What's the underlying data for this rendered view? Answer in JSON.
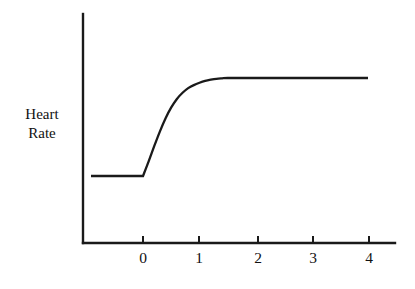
{
  "chart_data": {
    "type": "line",
    "title": "",
    "subtitle": "",
    "xlabel": "",
    "ylabel": "Heart Rate",
    "ylabel_lines": [
      "Heart",
      "Rate"
    ],
    "x_tick_labels": [
      "0",
      "1",
      "2",
      "3",
      "4"
    ],
    "x_tick_values": [
      0,
      1,
      2,
      3,
      4
    ],
    "y_tick_labels": [],
    "xlim": [
      -0.93,
      4.5
    ],
    "ylim": [
      0,
      1.38
    ],
    "grid": false,
    "legend": null,
    "annotations": [],
    "axis_style": {
      "x_axis": true,
      "y_axis": true,
      "ticks_direction": "up",
      "color": "#1a1a1a"
    },
    "series": [
      {
        "name": "Heart Rate",
        "color": "#1a1a1a",
        "description": "Flat baseline before time 0, rapid rise starting at 0, exponential approach to a steady plateau reached by about t=1.5, held flat to t=4",
        "x": [
          -0.93,
          -0.7,
          -0.5,
          -0.3,
          -0.1,
          0.0,
          0.1,
          0.2,
          0.3,
          0.4,
          0.5,
          0.6,
          0.7,
          0.8,
          0.9,
          1.0,
          1.1,
          1.2,
          1.3,
          1.4,
          1.5,
          1.75,
          2.0,
          2.5,
          3.0,
          3.5,
          4.0
        ],
        "y": [
          0.405,
          0.405,
          0.405,
          0.405,
          0.405,
          0.405,
          0.5,
          0.6,
          0.695,
          0.78,
          0.85,
          0.905,
          0.945,
          0.975,
          0.995,
          1.01,
          1.022,
          1.03,
          1.036,
          1.039,
          1.041,
          1.041,
          1.041,
          1.041,
          1.041,
          1.041,
          1.041
        ]
      }
    ]
  },
  "geometry": {
    "width": 415,
    "height": 289,
    "axis_origin_x": 83,
    "axis_origin_y": 243,
    "axis_top_y": 14,
    "axis_right_x": 395,
    "tick_pixels_x": [
      143,
      199,
      258,
      313,
      369
    ],
    "tick_height": 7,
    "baseline_y": 176,
    "plateau_y": 78,
    "series_start_x": 91,
    "series_end_x": 368,
    "rise_start_x": 143
  }
}
